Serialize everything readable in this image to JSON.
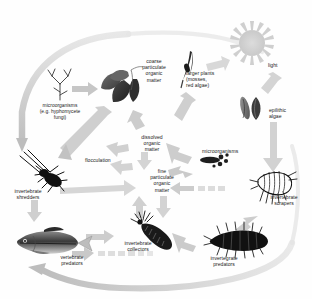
{
  "diagram": {
    "type": "flow-diagram",
    "palette": {
      "background": "#fefefe",
      "arrow_light": "#d6d6d6",
      "arrow_mid": "#b9b9b9",
      "arrow_dark": "#9a9a9a",
      "organism_dark": "#1a1a1a",
      "organism_mid": "#555555",
      "organism_light": "#aaaaaa",
      "text": "#1a1a1a"
    },
    "nodes": [
      {
        "id": "light",
        "label": "light",
        "x": 268,
        "y": 62,
        "align": "left"
      },
      {
        "id": "larger-plants",
        "label": "larger plants\n(mosses,\nred algae)",
        "x": 186,
        "y": 70,
        "align": "left"
      },
      {
        "id": "coarse-pom",
        "label": "coarse\nparticulate\norganic\nmatter",
        "x": 134,
        "y": 58,
        "align": "center"
      },
      {
        "id": "microorganisms-fungi",
        "label": "microorganisms\n(e.g. hyphomycete\nfungi)",
        "x": 38,
        "y": 103,
        "align": "center"
      },
      {
        "id": "epilithic-algae",
        "label": "epilithic\nalgae",
        "x": 269,
        "y": 107,
        "align": "left"
      },
      {
        "id": "dissolved-om",
        "label": "dissolved\norganic\nmatter",
        "x": 139,
        "y": 134,
        "align": "center"
      },
      {
        "id": "flocculation",
        "label": "flocculation",
        "x": 85,
        "y": 157,
        "align": "left"
      },
      {
        "id": "microorganisms-bacteria",
        "label": "microorganisms",
        "x": 202,
        "y": 148,
        "align": "left"
      },
      {
        "id": "fine-pom",
        "label": "fine\nparticulate\norganic\nmatter",
        "x": 148,
        "y": 168,
        "align": "center"
      },
      {
        "id": "invertebrate-shredders",
        "label": "invertebrate\nshredders",
        "x": 8,
        "y": 188,
        "align": "left"
      },
      {
        "id": "invertebrate-scrapers",
        "label": "invertebrate\nscrapers",
        "x": 262,
        "y": 194,
        "align": "left"
      },
      {
        "id": "invertebrate-collectors",
        "label": "invertebrate\ncollectors",
        "x": 118,
        "y": 240,
        "align": "left"
      },
      {
        "id": "vertebrate-predators",
        "label": "vertebrate\npredators",
        "x": 52,
        "y": 254,
        "align": "left"
      },
      {
        "id": "invertebrate-predators",
        "label": "invertegrate\npredators",
        "x": 203,
        "y": 255,
        "align": "left"
      }
    ],
    "icons": [
      {
        "id": "sun-icon",
        "depicts": "sun"
      },
      {
        "id": "moss-plant-icon",
        "depicts": "larger-plant"
      },
      {
        "id": "leaves-icon",
        "depicts": "leaf-litter"
      },
      {
        "id": "fungal-hypha-icon",
        "depicts": "hyphomycete-fungus"
      },
      {
        "id": "algae-icon",
        "depicts": "epilithic-algae"
      },
      {
        "id": "bacteria-icon",
        "depicts": "bacteria-cluster"
      },
      {
        "id": "stonefly-icon",
        "depicts": "invertebrate-shredder"
      },
      {
        "id": "amphipod-icon",
        "depicts": "invertebrate-scraper"
      },
      {
        "id": "blackfly-larva-icon",
        "depicts": "invertebrate-collector"
      },
      {
        "id": "fish-icon",
        "depicts": "vertebrate-predator"
      },
      {
        "id": "centipede-larva-icon",
        "depicts": "invertebrate-predator"
      }
    ]
  }
}
